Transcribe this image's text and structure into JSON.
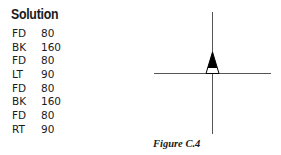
{
  "solution": {
    "title": "Solution",
    "commands": [
      {
        "cmd": "FD",
        "arg": "80"
      },
      {
        "cmd": "BK",
        "arg": "160"
      },
      {
        "cmd": "FD",
        "arg": "80"
      },
      {
        "cmd": "LT",
        "arg": "90"
      },
      {
        "cmd": "FD",
        "arg": "80"
      },
      {
        "cmd": "BK",
        "arg": "160"
      },
      {
        "cmd": "FD",
        "arg": "80"
      },
      {
        "cmd": "RT",
        "arg": "90"
      }
    ]
  },
  "figure": {
    "caption": "Figure C.4",
    "line_color": "#555555",
    "turtle_color": "#000000"
  }
}
